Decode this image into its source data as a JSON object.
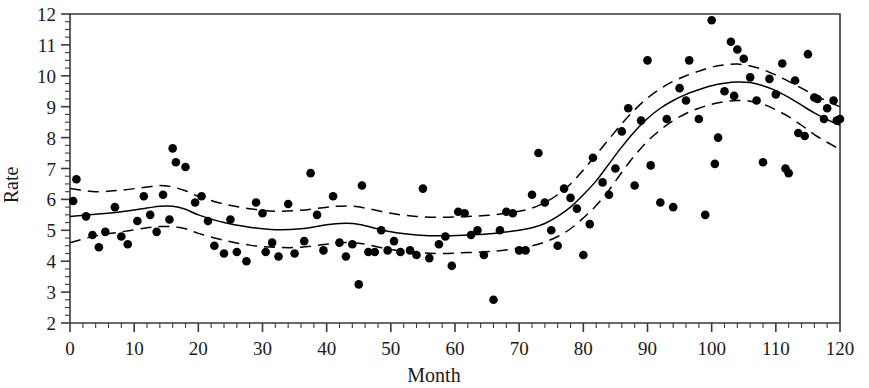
{
  "chart_data": {
    "type": "scatter",
    "title": "",
    "xlabel": "Month",
    "ylabel": "Rate",
    "xlim": [
      0,
      120
    ],
    "ylim": [
      2,
      12
    ],
    "grid": false,
    "legend": "none",
    "x_ticks": [
      0,
      10,
      20,
      30,
      40,
      50,
      60,
      70,
      80,
      90,
      100,
      110,
      120
    ],
    "x_tick_labels": [
      "0",
      "10",
      "20",
      "30",
      "40",
      "50",
      "60",
      "70",
      "80",
      "90",
      "100",
      "110",
      "120"
    ],
    "x_minor_tick_step": 2,
    "y_ticks": [
      2,
      3,
      4,
      5,
      6,
      7,
      8,
      9,
      10,
      11,
      12
    ],
    "y_tick_labels": [
      "2",
      "3",
      "4",
      "5",
      "6",
      "7",
      "8",
      "9",
      "10",
      "11",
      "12"
    ],
    "y_minor_tick_step": 0.25,
    "marker": {
      "shape": "circle",
      "color": "#000000",
      "size": 7
    },
    "series": [
      {
        "name": "observations",
        "style": "points",
        "points": [
          [
            0.5,
            5.95
          ],
          [
            1.0,
            6.65
          ],
          [
            2.5,
            5.45
          ],
          [
            3.5,
            4.85
          ],
          [
            4.5,
            4.45
          ],
          [
            5.5,
            4.95
          ],
          [
            7.0,
            5.75
          ],
          [
            8.0,
            4.8
          ],
          [
            9.0,
            4.55
          ],
          [
            10.5,
            5.3
          ],
          [
            11.5,
            6.1
          ],
          [
            12.5,
            5.5
          ],
          [
            13.5,
            4.95
          ],
          [
            14.5,
            6.15
          ],
          [
            15.5,
            5.35
          ],
          [
            16.0,
            7.65
          ],
          [
            16.5,
            7.2
          ],
          [
            18.0,
            7.05
          ],
          [
            19.5,
            5.9
          ],
          [
            20.5,
            6.1
          ],
          [
            21.5,
            5.3
          ],
          [
            22.5,
            4.5
          ],
          [
            24.0,
            4.25
          ],
          [
            25.0,
            5.35
          ],
          [
            26.0,
            4.3
          ],
          [
            27.5,
            4.0
          ],
          [
            29.0,
            5.9
          ],
          [
            30.0,
            5.55
          ],
          [
            30.5,
            4.3
          ],
          [
            31.5,
            4.6
          ],
          [
            32.5,
            4.15
          ],
          [
            34.0,
            5.85
          ],
          [
            35.0,
            4.25
          ],
          [
            36.5,
            4.65
          ],
          [
            37.5,
            6.85
          ],
          [
            38.5,
            5.5
          ],
          [
            39.5,
            4.35
          ],
          [
            41.0,
            6.1
          ],
          [
            42.0,
            4.6
          ],
          [
            43.0,
            4.15
          ],
          [
            44.0,
            4.55
          ],
          [
            45.0,
            3.25
          ],
          [
            45.5,
            6.45
          ],
          [
            46.5,
            4.3
          ],
          [
            47.5,
            4.3
          ],
          [
            48.5,
            5.0
          ],
          [
            49.5,
            4.35
          ],
          [
            50.5,
            4.65
          ],
          [
            51.5,
            4.3
          ],
          [
            53.0,
            4.35
          ],
          [
            54.0,
            4.2
          ],
          [
            55.0,
            6.35
          ],
          [
            56.0,
            4.1
          ],
          [
            57.5,
            4.55
          ],
          [
            58.5,
            4.8
          ],
          [
            59.5,
            3.85
          ],
          [
            60.5,
            5.6
          ],
          [
            61.5,
            5.55
          ],
          [
            62.5,
            4.85
          ],
          [
            63.5,
            5.0
          ],
          [
            64.5,
            4.2
          ],
          [
            66.0,
            2.75
          ],
          [
            67.0,
            5.0
          ],
          [
            68.0,
            5.6
          ],
          [
            69.0,
            5.55
          ],
          [
            70.0,
            4.35
          ],
          [
            71.0,
            4.35
          ],
          [
            72.0,
            6.15
          ],
          [
            73.0,
            7.5
          ],
          [
            74.0,
            5.9
          ],
          [
            75.0,
            5.0
          ],
          [
            76.0,
            4.5
          ],
          [
            77.0,
            6.35
          ],
          [
            78.0,
            6.05
          ],
          [
            79.0,
            5.7
          ],
          [
            80.0,
            4.2
          ],
          [
            81.0,
            5.2
          ],
          [
            81.5,
            7.35
          ],
          [
            83.0,
            6.55
          ],
          [
            84.0,
            6.15
          ],
          [
            85.0,
            7.0
          ],
          [
            86.0,
            8.2
          ],
          [
            87.0,
            8.95
          ],
          [
            88.0,
            6.45
          ],
          [
            89.0,
            8.55
          ],
          [
            90.0,
            10.5
          ],
          [
            90.5,
            7.1
          ],
          [
            92.0,
            5.9
          ],
          [
            93.0,
            8.6
          ],
          [
            94.0,
            5.75
          ],
          [
            95.0,
            9.6
          ],
          [
            96.0,
            9.2
          ],
          [
            96.5,
            10.5
          ],
          [
            98.0,
            8.6
          ],
          [
            99.0,
            5.5
          ],
          [
            100.0,
            11.8
          ],
          [
            100.5,
            7.15
          ],
          [
            101.0,
            8.0
          ],
          [
            102.0,
            9.5
          ],
          [
            103.0,
            11.1
          ],
          [
            103.5,
            9.35
          ],
          [
            104.0,
            10.85
          ],
          [
            105.0,
            10.55
          ],
          [
            106.0,
            9.95
          ],
          [
            107.0,
            9.2
          ],
          [
            108.0,
            7.2
          ],
          [
            109.0,
            9.9
          ],
          [
            110.0,
            9.4
          ],
          [
            111.0,
            10.4
          ],
          [
            111.5,
            7.0
          ],
          [
            112.0,
            6.85
          ],
          [
            113.0,
            9.85
          ],
          [
            113.5,
            8.15
          ],
          [
            114.5,
            8.05
          ],
          [
            115.0,
            10.7
          ],
          [
            116.0,
            9.3
          ],
          [
            116.5,
            9.25
          ],
          [
            117.5,
            8.6
          ],
          [
            118.0,
            8.95
          ],
          [
            119.0,
            9.2
          ],
          [
            119.5,
            8.55
          ],
          [
            120.0,
            8.6
          ]
        ]
      },
      {
        "name": "smoothed-fit",
        "style": "solid-line",
        "points": [
          [
            0,
            5.45
          ],
          [
            4,
            5.52
          ],
          [
            8,
            5.6
          ],
          [
            12,
            5.72
          ],
          [
            14,
            5.78
          ],
          [
            16,
            5.78
          ],
          [
            18,
            5.68
          ],
          [
            20,
            5.5
          ],
          [
            24,
            5.25
          ],
          [
            28,
            5.1
          ],
          [
            32,
            5.02
          ],
          [
            36,
            5.05
          ],
          [
            40,
            5.18
          ],
          [
            42,
            5.22
          ],
          [
            44,
            5.22
          ],
          [
            46,
            5.15
          ],
          [
            50,
            4.95
          ],
          [
            54,
            4.85
          ],
          [
            58,
            4.82
          ],
          [
            62,
            4.85
          ],
          [
            66,
            4.9
          ],
          [
            70,
            5.0
          ],
          [
            72,
            5.08
          ],
          [
            74,
            5.22
          ],
          [
            76,
            5.45
          ],
          [
            78,
            5.75
          ],
          [
            80,
            6.15
          ],
          [
            82,
            6.6
          ],
          [
            84,
            7.15
          ],
          [
            86,
            7.7
          ],
          [
            88,
            8.2
          ],
          [
            90,
            8.62
          ],
          [
            92,
            8.95
          ],
          [
            94,
            9.2
          ],
          [
            96,
            9.4
          ],
          [
            98,
            9.55
          ],
          [
            100,
            9.68
          ],
          [
            102,
            9.76
          ],
          [
            104,
            9.8
          ],
          [
            106,
            9.78
          ],
          [
            108,
            9.68
          ],
          [
            110,
            9.52
          ],
          [
            112,
            9.3
          ],
          [
            114,
            9.05
          ],
          [
            116,
            8.8
          ],
          [
            118,
            8.58
          ],
          [
            120,
            8.4
          ]
        ]
      },
      {
        "name": "upper-confidence-band",
        "style": "dashed-line",
        "points": [
          [
            0,
            6.35
          ],
          [
            4,
            6.25
          ],
          [
            8,
            6.3
          ],
          [
            12,
            6.4
          ],
          [
            14,
            6.45
          ],
          [
            16,
            6.4
          ],
          [
            18,
            6.28
          ],
          [
            20,
            6.1
          ],
          [
            24,
            5.85
          ],
          [
            28,
            5.7
          ],
          [
            32,
            5.62
          ],
          [
            36,
            5.65
          ],
          [
            40,
            5.75
          ],
          [
            42,
            5.78
          ],
          [
            44,
            5.78
          ],
          [
            46,
            5.72
          ],
          [
            50,
            5.55
          ],
          [
            54,
            5.45
          ],
          [
            58,
            5.42
          ],
          [
            62,
            5.45
          ],
          [
            66,
            5.5
          ],
          [
            70,
            5.62
          ],
          [
            72,
            5.72
          ],
          [
            74,
            5.9
          ],
          [
            76,
            6.15
          ],
          [
            78,
            6.5
          ],
          [
            80,
            6.95
          ],
          [
            82,
            7.45
          ],
          [
            84,
            7.95
          ],
          [
            86,
            8.45
          ],
          [
            88,
            8.9
          ],
          [
            90,
            9.28
          ],
          [
            92,
            9.58
          ],
          [
            94,
            9.82
          ],
          [
            96,
            10.0
          ],
          [
            98,
            10.15
          ],
          [
            100,
            10.28
          ],
          [
            102,
            10.35
          ],
          [
            104,
            10.38
          ],
          [
            106,
            10.32
          ],
          [
            108,
            10.2
          ],
          [
            110,
            10.02
          ],
          [
            112,
            9.82
          ],
          [
            114,
            9.6
          ],
          [
            116,
            9.38
          ],
          [
            118,
            9.18
          ],
          [
            120,
            9.0
          ]
        ]
      },
      {
        "name": "lower-confidence-band",
        "style": "dashed-line",
        "points": [
          [
            0,
            4.6
          ],
          [
            4,
            4.82
          ],
          [
            8,
            4.95
          ],
          [
            12,
            5.08
          ],
          [
            14,
            5.12
          ],
          [
            16,
            5.12
          ],
          [
            18,
            5.05
          ],
          [
            20,
            4.9
          ],
          [
            24,
            4.68
          ],
          [
            28,
            4.52
          ],
          [
            32,
            4.45
          ],
          [
            36,
            4.45
          ],
          [
            40,
            4.55
          ],
          [
            42,
            4.6
          ],
          [
            44,
            4.6
          ],
          [
            46,
            4.55
          ],
          [
            50,
            4.38
          ],
          [
            54,
            4.28
          ],
          [
            58,
            4.25
          ],
          [
            62,
            4.28
          ],
          [
            66,
            4.32
          ],
          [
            70,
            4.42
          ],
          [
            72,
            4.5
          ],
          [
            74,
            4.62
          ],
          [
            76,
            4.8
          ],
          [
            78,
            5.05
          ],
          [
            80,
            5.4
          ],
          [
            82,
            5.8
          ],
          [
            84,
            6.3
          ],
          [
            86,
            6.88
          ],
          [
            88,
            7.42
          ],
          [
            90,
            7.88
          ],
          [
            92,
            8.25
          ],
          [
            94,
            8.55
          ],
          [
            96,
            8.78
          ],
          [
            98,
            8.95
          ],
          [
            100,
            9.08
          ],
          [
            102,
            9.16
          ],
          [
            104,
            9.2
          ],
          [
            106,
            9.18
          ],
          [
            108,
            9.08
          ],
          [
            110,
            8.9
          ],
          [
            112,
            8.68
          ],
          [
            114,
            8.4
          ],
          [
            116,
            8.1
          ],
          [
            118,
            7.85
          ],
          [
            120,
            7.62
          ]
        ]
      }
    ]
  },
  "plot": {
    "frame_color": "#3a3a3a",
    "ink_color": "#000000"
  }
}
